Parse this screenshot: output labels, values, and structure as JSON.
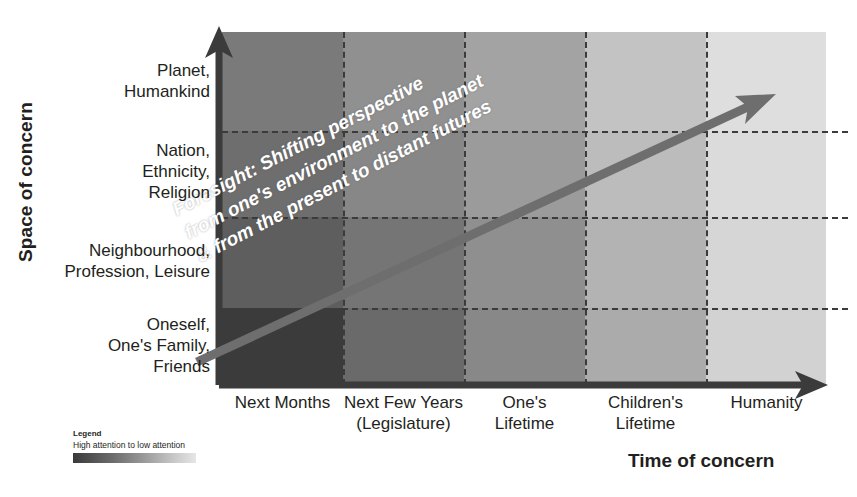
{
  "axes": {
    "y_title": "Space of concern",
    "x_title": "Time of concern"
  },
  "chart_data": {
    "type": "heatmap",
    "xlabel": "Time of concern",
    "ylabel": "Space of concern",
    "grid": true,
    "legend_position": "bottom-left",
    "categories_x": [
      "Next Months",
      "Next Few Years (Legislature)",
      "One's Lifetime",
      "Children's Lifetime",
      "Humanity"
    ],
    "categories_y": [
      "Planet, Humankind",
      "Nation, Ethnicity, Religion",
      "Neighbourhood, Profession, Leisure",
      "Oneself, One's Family, Friends"
    ],
    "value_meaning": "Attention level: 1 = high attention (dark), 0 = low attention (light)",
    "values": [
      [
        0.62,
        0.5,
        0.4,
        0.26,
        0.14
      ],
      [
        0.7,
        0.55,
        0.44,
        0.3,
        0.16
      ],
      [
        0.8,
        0.66,
        0.5,
        0.34,
        0.18
      ],
      [
        0.95,
        0.74,
        0.56,
        0.38,
        0.2
      ]
    ],
    "cell_colors": [
      [
        "#7a7a7a",
        "#909090",
        "#a3a3a3",
        "#c3c3c3",
        "#dedede"
      ],
      [
        "#6e6e6e",
        "#878787",
        "#9b9b9b",
        "#bcbcbc",
        "#dbdbdb"
      ],
      [
        "#5e5e5e",
        "#757575",
        "#8f8f8f",
        "#b3b3b3",
        "#d6d6d6"
      ],
      [
        "#3b3b3b",
        "#6a6a6a",
        "#888888",
        "#ababab",
        "#d2d2d2"
      ]
    ],
    "annotation": "Foresight: Shifting perspective from one's environment to the planet & from the present to distant futures",
    "arrow": {
      "label": "foresight-arrow",
      "from": "bottom-left (Oneself / Next Months)",
      "to": "top-right (Planet, Humankind / Humanity)",
      "color": "#6e6e6e"
    }
  },
  "y_labels": [
    {
      "lines": [
        "Planet,",
        "Humankind"
      ]
    },
    {
      "lines": [
        "Nation,",
        "Ethnicity,",
        "Religion"
      ]
    },
    {
      "lines": [
        "Neighbourhood,",
        "Profession, Leisure"
      ]
    },
    {
      "lines": [
        "Oneself,",
        "One's Family,",
        "Friends"
      ]
    }
  ],
  "x_labels": [
    {
      "lines": [
        "Next Months"
      ]
    },
    {
      "lines": [
        "Next Few Years",
        "(Legislature)"
      ]
    },
    {
      "lines": [
        "One's",
        "Lifetime"
      ]
    },
    {
      "lines": [
        "Children's",
        "Lifetime"
      ]
    },
    {
      "lines": [
        "Humanity"
      ]
    }
  ],
  "diagonal_caption": {
    "line1": "Foresight: Shifting perspective",
    "line2": "from one's environment to the planet",
    "line3": "& from the present to distant futures"
  },
  "legend": {
    "title": "Legend",
    "subtitle": "High attention to low attention",
    "gradient_from": "#3a3a3a",
    "gradient_to": "#e6e6e6"
  },
  "colors": {
    "axis": "#3b3b3b",
    "grid": "#3b3b3b",
    "arrow": "#6e6e6e",
    "text": "#231f20"
  }
}
